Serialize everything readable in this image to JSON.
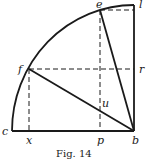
{
  "figure": {
    "caption": "Fig. 14",
    "stroke_color": "#1a1a1a",
    "points": {
      "c": {
        "label": "c",
        "x": 12,
        "y": 131
      },
      "b": {
        "label": "b",
        "x": 134,
        "y": 131
      },
      "l": {
        "label": "l",
        "x": 134,
        "y": 5
      },
      "e": {
        "label": "e",
        "x": 100,
        "y": 10
      },
      "f": {
        "label": "f",
        "x": 29,
        "y": 69
      },
      "r": {
        "label": "r",
        "x": 134,
        "y": 69
      },
      "x": {
        "label": "x",
        "x": 29,
        "y": 131
      },
      "p": {
        "label": "p",
        "x": 100,
        "y": 131
      },
      "u": {
        "label": "u",
        "x": 100,
        "y": 108
      }
    },
    "solid_segments": [
      [
        "c",
        "b"
      ],
      [
        "b",
        "l"
      ],
      [
        "f",
        "b"
      ],
      [
        "e",
        "b"
      ]
    ],
    "dashed_segments": [
      [
        "e",
        "l"
      ],
      [
        "f",
        "r"
      ],
      [
        "f",
        "x"
      ],
      [
        "e",
        "p"
      ]
    ],
    "arc": {
      "center": "b",
      "from": "c",
      "to": "l"
    }
  }
}
